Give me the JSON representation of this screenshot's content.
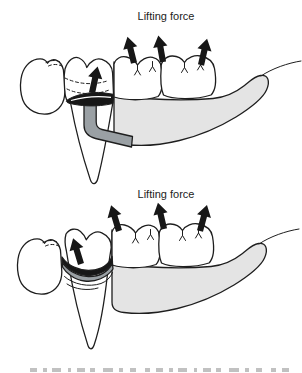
{
  "figure": {
    "type": "dental-lifting-force-diagram",
    "panels": [
      {
        "id": "top",
        "label": "Lifting force",
        "large_arrow_count": 3,
        "small_arrow_count": 1
      },
      {
        "id": "bottom",
        "label": "Lifting force",
        "large_arrow_count": 3,
        "small_arrow_count": 1
      }
    ],
    "colors": {
      "outline": "#1e1e1e",
      "tooth_fill": "#ffffff",
      "denture_base_fill": "#e4e4e4",
      "clasp_gray": "#9aa0a4",
      "arrow_black": "#171717",
      "caption_gray": "#8f8f8f",
      "background": "#ffffff"
    },
    "caption": {
      "cropped": true
    }
  }
}
